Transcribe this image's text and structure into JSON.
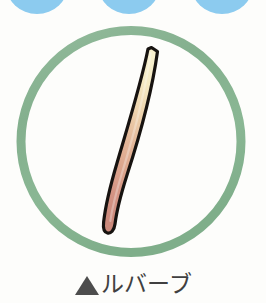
{
  "page": {
    "width": 266,
    "height": 303,
    "background_color": "#fdfdfb"
  },
  "decor": {
    "scallops": {
      "color": "#8ccbef",
      "count": 3,
      "items": [
        {
          "left": 6,
          "top": -44,
          "width": 62,
          "height": 58
        },
        {
          "left": 98,
          "top": -44,
          "width": 62,
          "height": 58
        },
        {
          "left": 191,
          "top": -44,
          "width": 62,
          "height": 58
        }
      ]
    }
  },
  "illustration": {
    "label": "rhubarb-stalk-illustration",
    "ring": {
      "name": "green-circle-frame",
      "stroke_color": "#88b491",
      "stroke_width": 9,
      "center_x": 116,
      "center_y": 117,
      "radius": 111
    },
    "stalk": {
      "name": "rhubarb-stalk",
      "outline_color": "#171310",
      "outline_width": 3.2,
      "tip_color": "#f6eec9",
      "mid_color": "#e3b197",
      "base_color": "#cf8f80",
      "top_point": {
        "x": 154,
        "y": 47
      },
      "bottom_point": {
        "x": 110,
        "y": 233
      }
    }
  },
  "caption": {
    "marker_shape": "filled-triangle-up",
    "marker_color": "#4d4d4d",
    "text": "ルバーブ",
    "text_color": "#404040",
    "romanization_meaning": "rhubarb"
  }
}
